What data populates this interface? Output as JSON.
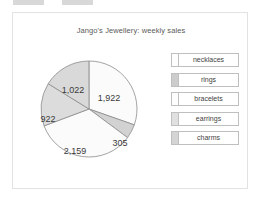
{
  "chrome": {
    "bar_left": "",
    "bar_right": ""
  },
  "card": {
    "border_color": "#e2e2e2",
    "background": "#ffffff"
  },
  "chart_data": {
    "type": "pie",
    "title": "Jango's Jewellery: weekly sales",
    "xlabel": "",
    "ylabel": "",
    "grid": false,
    "legend_position": "right",
    "total": 6330,
    "categories": [
      "necklaces",
      "rings",
      "bracelets",
      "earrings",
      "charms"
    ],
    "values": [
      1922,
      305,
      2159,
      922,
      1022
    ],
    "value_labels": [
      "1,922",
      "305",
      "2,159",
      "922",
      "1,022"
    ],
    "start_angle_deg": 0,
    "direction": "clockwise",
    "slices": [
      {
        "name": "necklaces",
        "value": 1922,
        "label": "1,922",
        "color": "#fbfbfb",
        "start_deg": 0,
        "sweep_deg": 109.3,
        "label_x": 82,
        "label_y": 52
      },
      {
        "name": "rings",
        "value": 305,
        "label": "305",
        "color": "#d2d2d2",
        "start_deg": 109.3,
        "sweep_deg": 17.3,
        "label_x": 93,
        "label_y": 97
      },
      {
        "name": "bracelets",
        "value": 2159,
        "label": "2,159",
        "color": "#fbfbfb",
        "start_deg": 126.6,
        "sweep_deg": 122.8,
        "label_x": 48,
        "label_y": 105
      },
      {
        "name": "earrings",
        "value": 922,
        "label": "922",
        "color": "#dcdcdc",
        "start_deg": 249.4,
        "sweep_deg": 52.4,
        "label_x": 21,
        "label_y": 73
      },
      {
        "name": "charms",
        "value": 1022,
        "label": "1,022",
        "color": "#d9d9d9",
        "start_deg": 301.8,
        "sweep_deg": 58.1,
        "label_x": 46,
        "label_y": 44
      }
    ]
  },
  "legend": {
    "items": [
      {
        "label": "necklaces",
        "swatch_color": "#fdfdfd"
      },
      {
        "label": "rings",
        "swatch_color": "#cccccc"
      },
      {
        "label": "bracelets",
        "swatch_color": "#fdfdfd"
      },
      {
        "label": "earrings",
        "swatch_color": "#e0e0e0"
      },
      {
        "label": "charms",
        "swatch_color": "#d4d4d4"
      }
    ]
  }
}
